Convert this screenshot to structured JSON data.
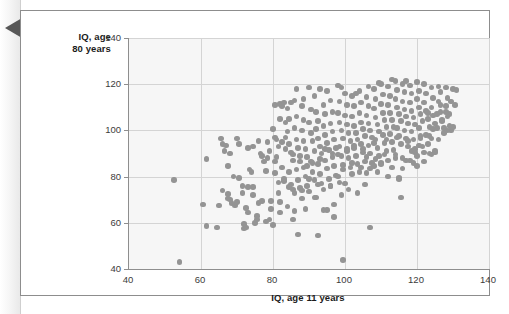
{
  "figure": {
    "margin_marker": "left-pointing-triangle"
  },
  "chart_data": {
    "type": "scatter",
    "title": "",
    "xlabel": "IQ, age 11 years",
    "ylabel": "IQ, age 80 years",
    "ylabel_line1": "IQ, age",
    "ylabel_line2": "80 years",
    "xlim": [
      40,
      140
    ],
    "ylim": [
      40,
      140
    ],
    "xticks": [
      40,
      60,
      80,
      100,
      120,
      140
    ],
    "yticks": [
      40,
      60,
      80,
      100,
      120,
      140
    ],
    "xtick_labels": [
      "40",
      "60",
      "80",
      "100",
      "120",
      "140"
    ],
    "ytick_labels": [
      "40",
      "60",
      "80",
      "100",
      "120",
      "140"
    ],
    "grid": true,
    "legend": "none",
    "marker_color": "#949494",
    "marker_size_px": 5.6,
    "plot_background": "#f6f6f6",
    "gridline_color": "#d4d4d4",
    "axis_color": "#8e8e8e",
    "n_points": 388,
    "correlation_description": "strong positive",
    "points": [
      [
        52.5,
        78.5
      ],
      [
        54.0,
        43.0
      ],
      [
        61.5,
        87.5
      ],
      [
        60.5,
        68.0
      ],
      [
        61.5,
        58.5
      ],
      [
        64.5,
        58.0
      ],
      [
        65.0,
        67.5
      ],
      [
        66.0,
        94.0
      ],
      [
        66.5,
        91.0
      ],
      [
        65.5,
        96.5
      ],
      [
        67.0,
        93.5
      ],
      [
        68.0,
        90.0
      ],
      [
        67.5,
        84.5
      ],
      [
        67.5,
        72.5
      ],
      [
        68.5,
        68.5
      ],
      [
        69.5,
        67.5
      ],
      [
        68.0,
        70.0
      ],
      [
        70.5,
        94.0
      ],
      [
        70.5,
        79.5
      ],
      [
        71.5,
        73.0
      ],
      [
        72.0,
        57.5
      ],
      [
        72.0,
        59.5
      ],
      [
        72.5,
        58.0
      ],
      [
        73.0,
        64.5
      ],
      [
        73.5,
        83.0
      ],
      [
        74.0,
        82.0
      ],
      [
        74.5,
        93.0
      ],
      [
        73.0,
        75.5
      ],
      [
        74.5,
        75.5
      ],
      [
        75.0,
        60.0
      ],
      [
        75.5,
        61.5
      ],
      [
        76.0,
        68.5
      ],
      [
        77.0,
        89.0
      ],
      [
        77.5,
        86.5
      ],
      [
        78.0,
        82.5
      ],
      [
        78.5,
        88.0
      ],
      [
        79.0,
        91.0
      ],
      [
        79.5,
        69.5
      ],
      [
        79.0,
        61.5
      ],
      [
        80.0,
        100.5
      ],
      [
        80.5,
        86.5
      ],
      [
        80.5,
        81.5
      ],
      [
        81.0,
        96.0
      ],
      [
        81.5,
        93.0
      ],
      [
        81.0,
        88.5
      ],
      [
        82.0,
        111.5
      ],
      [
        82.5,
        110.5
      ],
      [
        81.5,
        73.0
      ],
      [
        82.0,
        69.0
      ],
      [
        83.0,
        112.0
      ],
      [
        83.5,
        103.5
      ],
      [
        83.5,
        97.0
      ],
      [
        82.5,
        84.0
      ],
      [
        83.0,
        78.0
      ],
      [
        84.0,
        109.5
      ],
      [
        84.5,
        105.0
      ],
      [
        84.0,
        99.5
      ],
      [
        84.5,
        94.0
      ],
      [
        85.0,
        90.5
      ],
      [
        85.5,
        87.0
      ],
      [
        84.5,
        82.0
      ],
      [
        85.0,
        76.5
      ],
      [
        85.5,
        74.5
      ],
      [
        86.0,
        113.0
      ],
      [
        86.5,
        106.0
      ],
      [
        86.0,
        101.0
      ],
      [
        86.5,
        96.0
      ],
      [
        87.0,
        92.5
      ],
      [
        87.5,
        89.0
      ],
      [
        86.5,
        83.0
      ],
      [
        87.0,
        78.5
      ],
      [
        87.5,
        75.0
      ],
      [
        86.0,
        65.0
      ],
      [
        87.0,
        55.0
      ],
      [
        88.0,
        110.5
      ],
      [
        88.5,
        104.5
      ],
      [
        88.0,
        100.0
      ],
      [
        88.5,
        95.5
      ],
      [
        89.0,
        92.0
      ],
      [
        89.5,
        88.5
      ],
      [
        88.5,
        84.0
      ],
      [
        89.0,
        80.0
      ],
      [
        89.5,
        76.0
      ],
      [
        88.0,
        70.5
      ],
      [
        90.0,
        118.5
      ],
      [
        90.5,
        109.0
      ],
      [
        90.0,
        103.5
      ],
      [
        90.5,
        99.0
      ],
      [
        91.0,
        95.5
      ],
      [
        91.5,
        91.0
      ],
      [
        90.5,
        86.5
      ],
      [
        91.0,
        82.0
      ],
      [
        91.5,
        78.5
      ],
      [
        90.0,
        73.5
      ],
      [
        92.0,
        108.0
      ],
      [
        92.5,
        104.0
      ],
      [
        92.0,
        100.5
      ],
      [
        92.5,
        96.5
      ],
      [
        93.0,
        93.0
      ],
      [
        93.5,
        90.0
      ],
      [
        92.5,
        85.5
      ],
      [
        93.0,
        81.0
      ],
      [
        93.5,
        77.0
      ],
      [
        92.0,
        71.0
      ],
      [
        92.5,
        54.5
      ],
      [
        94.0,
        111.0
      ],
      [
        94.5,
        107.0
      ],
      [
        94.0,
        102.0
      ],
      [
        94.5,
        98.0
      ],
      [
        95.0,
        94.5
      ],
      [
        95.5,
        91.5
      ],
      [
        94.5,
        87.0
      ],
      [
        95.0,
        83.5
      ],
      [
        95.5,
        79.0
      ],
      [
        94.0,
        74.5
      ],
      [
        95.0,
        65.5
      ],
      [
        96.0,
        113.0
      ],
      [
        96.5,
        108.0
      ],
      [
        96.0,
        103.0
      ],
      [
        96.5,
        99.5
      ],
      [
        97.0,
        96.0
      ],
      [
        97.5,
        92.5
      ],
      [
        96.5,
        88.5
      ],
      [
        97.0,
        84.5
      ],
      [
        97.5,
        80.5
      ],
      [
        96.0,
        76.0
      ],
      [
        97.0,
        68.0
      ],
      [
        98.0,
        119.5
      ],
      [
        98.5,
        112.5
      ],
      [
        98.0,
        107.5
      ],
      [
        98.5,
        103.5
      ],
      [
        99.0,
        100.0
      ],
      [
        99.5,
        96.5
      ],
      [
        98.5,
        93.0
      ],
      [
        99.0,
        89.0
      ],
      [
        99.5,
        85.0
      ],
      [
        98.0,
        80.0
      ],
      [
        99.0,
        72.0
      ],
      [
        99.5,
        44.0
      ],
      [
        100.0,
        116.0
      ],
      [
        100.5,
        111.0
      ],
      [
        100.0,
        106.5
      ],
      [
        100.5,
        102.5
      ],
      [
        101.0,
        99.0
      ],
      [
        101.5,
        95.5
      ],
      [
        100.5,
        92.0
      ],
      [
        101.0,
        88.0
      ],
      [
        101.5,
        84.0
      ],
      [
        100.0,
        77.0
      ],
      [
        102.0,
        115.0
      ],
      [
        102.5,
        110.5
      ],
      [
        102.0,
        106.0
      ],
      [
        102.5,
        102.0
      ],
      [
        103.0,
        99.0
      ],
      [
        103.5,
        96.0
      ],
      [
        102.5,
        92.5
      ],
      [
        103.0,
        89.0
      ],
      [
        103.5,
        85.5
      ],
      [
        102.0,
        81.0
      ],
      [
        104.0,
        117.0
      ],
      [
        104.5,
        112.0
      ],
      [
        104.0,
        107.5
      ],
      [
        104.5,
        103.5
      ],
      [
        105.0,
        100.5
      ],
      [
        105.5,
        97.5
      ],
      [
        104.5,
        94.0
      ],
      [
        105.0,
        90.5
      ],
      [
        105.5,
        86.5
      ],
      [
        104.0,
        82.0
      ],
      [
        106.0,
        114.5
      ],
      [
        106.5,
        110.5
      ],
      [
        106.0,
        106.5
      ],
      [
        106.5,
        103.0
      ],
      [
        107.0,
        100.0
      ],
      [
        107.5,
        97.0
      ],
      [
        106.5,
        93.5
      ],
      [
        107.0,
        90.0
      ],
      [
        107.5,
        86.0
      ],
      [
        106.0,
        81.5
      ],
      [
        107.0,
        58.0
      ],
      [
        108.0,
        118.0
      ],
      [
        108.5,
        113.5
      ],
      [
        108.0,
        109.5
      ],
      [
        108.5,
        105.5
      ],
      [
        109.0,
        102.5
      ],
      [
        109.5,
        99.5
      ],
      [
        108.5,
        96.0
      ],
      [
        109.0,
        92.5
      ],
      [
        109.5,
        89.0
      ],
      [
        108.0,
        84.5
      ],
      [
        110.0,
        120.0
      ],
      [
        110.5,
        115.5
      ],
      [
        110.0,
        111.5
      ],
      [
        110.5,
        107.5
      ],
      [
        111.0,
        104.5
      ],
      [
        111.5,
        101.5
      ],
      [
        110.5,
        98.0
      ],
      [
        111.0,
        94.5
      ],
      [
        111.5,
        91.0
      ],
      [
        110.0,
        86.0
      ],
      [
        112.0,
        119.0
      ],
      [
        112.5,
        115.0
      ],
      [
        112.0,
        111.0
      ],
      [
        112.5,
        107.5
      ],
      [
        113.0,
        104.5
      ],
      [
        113.5,
        101.5
      ],
      [
        112.5,
        98.5
      ],
      [
        113.0,
        95.0
      ],
      [
        113.5,
        91.5
      ],
      [
        112.0,
        87.0
      ],
      [
        114.0,
        121.5
      ],
      [
        114.5,
        117.5
      ],
      [
        114.0,
        113.5
      ],
      [
        114.5,
        110.0
      ],
      [
        115.0,
        107.0
      ],
      [
        115.5,
        104.0
      ],
      [
        114.5,
        101.0
      ],
      [
        115.0,
        97.5
      ],
      [
        115.5,
        94.0
      ],
      [
        114.0,
        89.5
      ],
      [
        115.0,
        79.5
      ],
      [
        115.5,
        71.0
      ],
      [
        116.0,
        120.0
      ],
      [
        116.5,
        116.5
      ],
      [
        116.0,
        112.5
      ],
      [
        116.5,
        109.0
      ],
      [
        117.0,
        106.0
      ],
      [
        117.5,
        103.0
      ],
      [
        116.5,
        100.0
      ],
      [
        117.0,
        96.5
      ],
      [
        117.5,
        93.0
      ],
      [
        116.0,
        88.0
      ],
      [
        118.0,
        119.5
      ],
      [
        118.5,
        116.0
      ],
      [
        118.0,
        112.0
      ],
      [
        118.5,
        108.5
      ],
      [
        119.0,
        105.5
      ],
      [
        119.5,
        102.5
      ],
      [
        118.5,
        99.5
      ],
      [
        119.0,
        96.0
      ],
      [
        119.5,
        92.0
      ],
      [
        118.0,
        87.0
      ],
      [
        120.0,
        121.0
      ],
      [
        120.5,
        117.0
      ],
      [
        120.0,
        113.5
      ],
      [
        120.5,
        110.0
      ],
      [
        121.0,
        107.0
      ],
      [
        121.5,
        104.0
      ],
      [
        120.5,
        101.0
      ],
      [
        121.0,
        97.5
      ],
      [
        121.5,
        93.0
      ],
      [
        120.0,
        89.0
      ],
      [
        122.0,
        120.0
      ],
      [
        122.5,
        116.0
      ],
      [
        122.0,
        112.0
      ],
      [
        122.5,
        108.5
      ],
      [
        123.0,
        105.0
      ],
      [
        123.5,
        101.5
      ],
      [
        122.5,
        98.0
      ],
      [
        123.0,
        94.0
      ],
      [
        122.0,
        90.5
      ],
      [
        123.5,
        90.0
      ],
      [
        124.0,
        118.5
      ],
      [
        124.5,
        114.0
      ],
      [
        124.0,
        110.0
      ],
      [
        124.5,
        106.5
      ],
      [
        125.0,
        103.0
      ],
      [
        125.5,
        107.0
      ],
      [
        124.5,
        100.5
      ],
      [
        124.0,
        96.5
      ],
      [
        125.0,
        91.0
      ],
      [
        126.0,
        119.0
      ],
      [
        126.5,
        116.5
      ],
      [
        126.0,
        112.5
      ],
      [
        126.5,
        108.0
      ],
      [
        127.0,
        104.5
      ],
      [
        127.5,
        101.0
      ],
      [
        126.5,
        111.0
      ],
      [
        128.0,
        118.5
      ],
      [
        128.5,
        114.0
      ],
      [
        128.0,
        110.5
      ],
      [
        128.5,
        106.0
      ],
      [
        129.0,
        102.0
      ],
      [
        129.5,
        112.5
      ],
      [
        130.0,
        118.0
      ],
      [
        130.5,
        111.0
      ],
      [
        129.5,
        100.0
      ],
      [
        131.0,
        117.5
      ],
      [
        93.0,
        118.0
      ],
      [
        86.5,
        118.0
      ],
      [
        80.5,
        111.0
      ],
      [
        82.0,
        105.0
      ],
      [
        85.0,
        112.0
      ],
      [
        88.5,
        113.5
      ],
      [
        91.5,
        115.0
      ],
      [
        95.0,
        117.0
      ],
      [
        99.0,
        118.5
      ],
      [
        103.0,
        116.0
      ],
      [
        106.5,
        119.0
      ],
      [
        109.5,
        120.5
      ],
      [
        113.0,
        122.0
      ],
      [
        117.0,
        121.5
      ],
      [
        70.0,
        96.5
      ],
      [
        73.0,
        92.5
      ],
      [
        76.5,
        90.0
      ],
      [
        69.0,
        80.0
      ],
      [
        71.5,
        76.0
      ],
      [
        74.5,
        72.0
      ],
      [
        77.0,
        69.5
      ],
      [
        79.5,
        66.0
      ],
      [
        84.0,
        67.0
      ],
      [
        89.0,
        66.0
      ],
      [
        94.0,
        65.5
      ],
      [
        91.5,
        71.0
      ],
      [
        97.0,
        62.5
      ],
      [
        85.5,
        61.5
      ],
      [
        82.0,
        64.5
      ],
      [
        80.0,
        59.0
      ],
      [
        78.0,
        60.5
      ],
      [
        75.5,
        63.0
      ],
      [
        72.5,
        66.5
      ],
      [
        70.0,
        69.0
      ],
      [
        67.5,
        70.5
      ],
      [
        66.0,
        74.0
      ],
      [
        112.0,
        80.0
      ],
      [
        115.0,
        79.0
      ],
      [
        109.0,
        82.0
      ],
      [
        118.5,
        91.0
      ],
      [
        119.5,
        90.5
      ],
      [
        121.0,
        96.5
      ],
      [
        124.0,
        89.5
      ],
      [
        125.0,
        90.5
      ],
      [
        128.5,
        100.0
      ],
      [
        130.0,
        101.5
      ],
      [
        127.0,
        104.0
      ],
      [
        123.0,
        107.5
      ],
      [
        90.0,
        79.0
      ],
      [
        92.5,
        76.5
      ],
      [
        96.0,
        76.0
      ],
      [
        98.5,
        77.5
      ],
      [
        101.0,
        74.5
      ],
      [
        103.5,
        73.0
      ],
      [
        105.5,
        76.5
      ],
      [
        88.0,
        74.0
      ],
      [
        86.0,
        73.0
      ],
      [
        84.5,
        75.5
      ],
      [
        83.0,
        79.0
      ],
      [
        81.5,
        77.5
      ],
      [
        99.5,
        83.0
      ],
      [
        102.0,
        86.0
      ],
      [
        104.5,
        84.0
      ],
      [
        107.0,
        83.5
      ],
      [
        110.0,
        85.5
      ],
      [
        113.0,
        84.0
      ],
      [
        116.0,
        83.5
      ],
      [
        119.0,
        86.0
      ],
      [
        106.0,
        88.5
      ],
      [
        108.5,
        87.5
      ],
      [
        111.0,
        89.5
      ],
      [
        114.0,
        88.0
      ],
      [
        117.0,
        87.0
      ],
      [
        120.0,
        84.5
      ],
      [
        122.0,
        86.5
      ],
      [
        126.0,
        96.0
      ],
      [
        127.5,
        99.0
      ],
      [
        129.0,
        107.0
      ],
      [
        96.5,
        90.0
      ],
      [
        94.5,
        92.0
      ],
      [
        93.0,
        87.5
      ],
      [
        91.0,
        86.0
      ],
      [
        89.5,
        84.5
      ],
      [
        87.5,
        86.5
      ],
      [
        85.5,
        89.5
      ],
      [
        83.5,
        92.0
      ],
      [
        82.5,
        95.0
      ],
      [
        80.5,
        97.0
      ],
      [
        78.5,
        95.0
      ],
      [
        76.0,
        95.5
      ],
      [
        100.5,
        91.0
      ],
      [
        98.0,
        89.5
      ],
      [
        102.5,
        93.5
      ],
      [
        105.0,
        92.0
      ],
      [
        108.0,
        94.5
      ],
      [
        111.5,
        96.0
      ],
      [
        114.5,
        97.0
      ],
      [
        117.5,
        95.5
      ],
      [
        120.5,
        93.5
      ],
      [
        123.5,
        97.5
      ],
      [
        125.5,
        101.0
      ],
      [
        128.0,
        108.0
      ]
    ]
  }
}
